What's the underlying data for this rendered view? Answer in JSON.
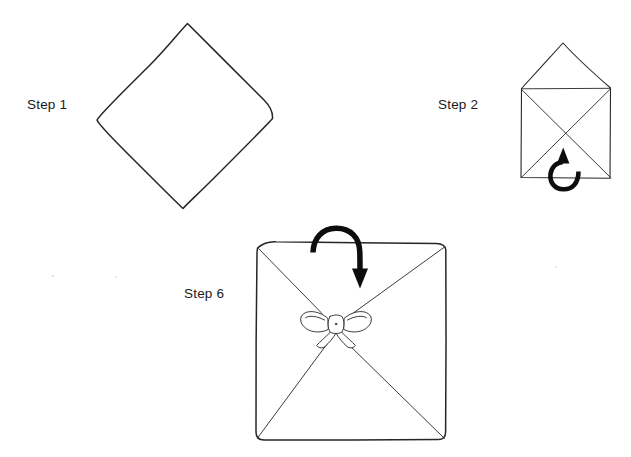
{
  "document": {
    "kind": "hand-drawn instructional diagram",
    "subject": "napkin / fabric folding steps",
    "background_color": "#ffffff",
    "ink_color": "#262626",
    "arrow_color": "#0d0d0d",
    "width": 631,
    "height": 457
  },
  "steps": [
    {
      "id": "step-1",
      "label": "Step 1",
      "label_x": 27,
      "label_y": 97,
      "figure": "diamond",
      "description": "square sheet rotated 45 degrees, drawn freehand",
      "corners": {
        "top": [
          187,
          23
        ],
        "right": [
          272,
          119
        ],
        "bottom": [
          183,
          209
        ],
        "left": [
          97,
          120
        ]
      }
    },
    {
      "id": "step-2",
      "label": "Step 2",
      "label_x": 438,
      "label_y": 97,
      "figure": "open-envelope",
      "description": "square body with raised triangular flap on top and X shaped diagonal folds inside",
      "body": {
        "left": 521,
        "top": 88,
        "right": 610,
        "bottom": 178
      },
      "flap_apex": [
        563,
        43
      ],
      "arrow": {
        "name": "fold-up-arrow",
        "direction": "up",
        "shape": "hook",
        "tail": [
          578,
          172
        ],
        "head": [
          563,
          150
        ]
      }
    },
    {
      "id": "step-6",
      "label": "Step 6",
      "label_x": 184,
      "label_y": 286,
      "figure": "tied-square",
      "description": "square with X shaped diagonal folds and a ribbon bow tied at the centre",
      "body": {
        "left": 256,
        "top": 241,
        "right": 446,
        "bottom": 440
      },
      "bow": {
        "name": "ribbon-bow",
        "center": [
          336,
          326
        ],
        "loops": 2,
        "tails": 2
      },
      "arrow": {
        "name": "fold-over-arrow",
        "direction": "down",
        "shape": "hook-over-top-edge",
        "tail": [
          313,
          252
        ],
        "head": [
          360,
          287
        ]
      }
    }
  ]
}
